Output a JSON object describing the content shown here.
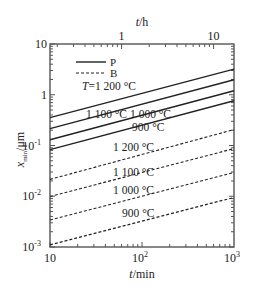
{
  "chart_data": {
    "type": "line",
    "title": "",
    "xlabel": "t/min",
    "xlabel_top": "t/h",
    "ylabel": "x_min/μm",
    "xscale": "log",
    "yscale": "log",
    "xlim": [
      10,
      1000
    ],
    "ylim": [
      0.001,
      10
    ],
    "grid": false,
    "x_ticks": [
      {
        "value": 10,
        "label": "10"
      },
      {
        "value": 100,
        "label": "10",
        "sup": "2"
      },
      {
        "value": 1000,
        "label": "10",
        "sup": "3"
      }
    ],
    "x_top_ticks": [
      {
        "value_min": 60,
        "label": "1"
      },
      {
        "value_min": 600,
        "label": "10"
      }
    ],
    "y_ticks": [
      {
        "value": 10,
        "label": "10"
      },
      {
        "value": 1,
        "label": "1"
      },
      {
        "value": 0.1,
        "label": "10",
        "sup": "-1"
      },
      {
        "value": 0.01,
        "label": "10",
        "sup": "-2"
      },
      {
        "value": 0.001,
        "label": "10",
        "sup": "-3"
      }
    ],
    "legend": {
      "position": "upper-left",
      "entries": [
        {
          "label": "P",
          "style": "solid"
        },
        {
          "label": "B",
          "style": "dashed"
        }
      ]
    },
    "series": [
      {
        "name": "P 1200 °C",
        "group": "P",
        "style": "solid",
        "x": [
          10,
          1000
        ],
        "values": [
          0.355,
          3.2
        ]
      },
      {
        "name": "P 1100 °C",
        "group": "P",
        "style": "solid",
        "x": [
          10,
          1000
        ],
        "values": [
          0.215,
          1.97
        ]
      },
      {
        "name": "P 1000 °C",
        "group": "P",
        "style": "solid",
        "x": [
          10,
          1000
        ],
        "values": [
          0.13,
          1.2
        ]
      },
      {
        "name": "P 900 °C",
        "group": "P",
        "style": "solid",
        "x": [
          10,
          1000
        ],
        "values": [
          0.083,
          0.76
        ]
      },
      {
        "name": "B 1200 °C",
        "group": "B",
        "style": "dashed",
        "x": [
          10,
          1000
        ],
        "values": [
          0.0215,
          0.206
        ]
      },
      {
        "name": "B 1100 °C",
        "group": "B",
        "style": "dashed",
        "x": [
          10,
          1000
        ],
        "values": [
          0.0099,
          0.087
        ]
      },
      {
        "name": "B 1000 °C",
        "group": "B",
        "style": "dashed",
        "x": [
          10,
          1000
        ],
        "values": [
          0.0034,
          0.0295
        ]
      },
      {
        "name": "B 900 °C",
        "group": "B",
        "style": "dashed",
        "x": [
          10,
          1000
        ],
        "values": [
          0.0011,
          0.0095
        ]
      }
    ],
    "annotations": [
      {
        "text": "T=1 200 °C",
        "italic_prefix": "T",
        "px": 82,
        "py": 90
      },
      {
        "text": "1 100 °C",
        "px": 86,
        "py": 118
      },
      {
        "text": "1 000 °C",
        "px": 130,
        "py": 118
      },
      {
        "text": "900 °C",
        "px": 132,
        "py": 131
      },
      {
        "text": "1 200 °C",
        "px": 113,
        "py": 151
      },
      {
        "text": "1 100 °C",
        "px": 113,
        "py": 176
      },
      {
        "text": "1 000 °C",
        "px": 113,
        "py": 194
      },
      {
        "text": "900 °C",
        "px": 122,
        "py": 217
      }
    ]
  },
  "layout": {
    "plot": {
      "left": 50,
      "right": 234,
      "top": 44,
      "bottom": 247
    },
    "line_color": "#222222",
    "frame_color": "#555555"
  }
}
